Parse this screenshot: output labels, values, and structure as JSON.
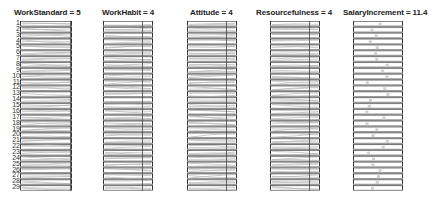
{
  "panels": [
    {
      "id": "work-standard",
      "title": "WorkStandard = 5",
      "x": 20,
      "width": 52,
      "marker": 0.97
    },
    {
      "id": "work-habit",
      "title": "WorkHabit = 4",
      "x": 103,
      "width": 50,
      "marker": 0.78
    },
    {
      "id": "attitude",
      "title": "Attitude = 4",
      "x": 187,
      "width": 50,
      "marker": 0.78
    },
    {
      "id": "resourcefulness",
      "title": "Resourcefulness = 4",
      "x": 270,
      "width": 50,
      "marker": 0.78
    },
    {
      "id": "salary-increment",
      "title": "SalaryIncrement = 11.4",
      "x": 353,
      "width": 50,
      "marker": null
    }
  ],
  "rows": [
    "1",
    "2",
    "3",
    "4",
    "5",
    "6",
    "7",
    "8",
    "9",
    "10",
    "11",
    "12",
    "13",
    "14",
    "15",
    "16",
    "17",
    "18",
    "19",
    "20",
    "21",
    "22",
    "23",
    "24",
    "25",
    "26",
    "27",
    "28",
    "29"
  ],
  "colors": {
    "frame": "#333333",
    "band": "#9a9a9a",
    "trace": "#b5b5b5",
    "marker": "#444444"
  }
}
